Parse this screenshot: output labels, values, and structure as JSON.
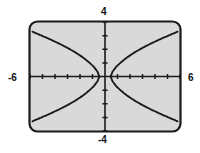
{
  "app": {
    "title": "Graphing Calculator Viewing Window",
    "device": "graphing-calculator"
  },
  "screen": {
    "background_color": "#d9d9d9",
    "border_color": "#1a1a1a",
    "curve_color": "#1a1a1a",
    "axis_color": "#1a1a1a",
    "label_color": "#111111"
  },
  "labels": {
    "x_min": "-6",
    "x_max": "6",
    "y_max": "4",
    "y_min": "-4"
  },
  "chart_data": {
    "type": "line",
    "title": "",
    "xlabel": "",
    "ylabel": "",
    "xlim": [
      -6,
      6
    ],
    "ylim": [
      -4,
      4
    ],
    "xtick_step": 1,
    "ytick_step": 1,
    "grid": false,
    "legend": false,
    "axes": {
      "x_axis_at_y": 0,
      "y_axis_at_x": 0,
      "tick_marks": true,
      "tick_labels_shown": [
        "-6",
        "6",
        "4",
        "-4"
      ]
    },
    "curve_description": "hyperbola opening left and right, centered at origin, vertices near x = -0.45 and x = 0.45",
    "series": [
      {
        "name": "right-branch-upper",
        "x": [
          0.45,
          0.6,
          0.9,
          1.3,
          1.8,
          2.4,
          3.0,
          3.7,
          4.4,
          5.1,
          5.8
        ],
        "y": [
          0.0,
          0.35,
          0.72,
          1.06,
          1.42,
          1.79,
          2.1,
          2.43,
          2.73,
          3.01,
          3.29
        ]
      },
      {
        "name": "right-branch-lower",
        "x": [
          0.45,
          0.6,
          0.9,
          1.3,
          1.8,
          2.4,
          3.0,
          3.7,
          4.4,
          5.1,
          5.8
        ],
        "y": [
          0.0,
          -0.35,
          -0.72,
          -1.06,
          -1.42,
          -1.79,
          -2.1,
          -2.43,
          -2.73,
          -3.01,
          -3.29
        ]
      },
      {
        "name": "left-branch-upper",
        "x": [
          -0.45,
          -0.6,
          -0.9,
          -1.3,
          -1.8,
          -2.4,
          -3.0,
          -3.7,
          -4.4,
          -5.1,
          -5.8
        ],
        "y": [
          0.0,
          0.35,
          0.72,
          1.06,
          1.42,
          1.79,
          2.1,
          2.43,
          2.73,
          3.01,
          3.29
        ]
      },
      {
        "name": "left-branch-lower",
        "x": [
          -0.45,
          -0.6,
          -0.9,
          -1.3,
          -1.8,
          -2.4,
          -3.0,
          -3.7,
          -4.4,
          -5.1,
          -5.8
        ],
        "y": [
          0.0,
          -0.35,
          -0.72,
          -1.06,
          -1.42,
          -1.79,
          -2.1,
          -2.43,
          -2.73,
          -3.01,
          -3.29
        ]
      }
    ]
  }
}
